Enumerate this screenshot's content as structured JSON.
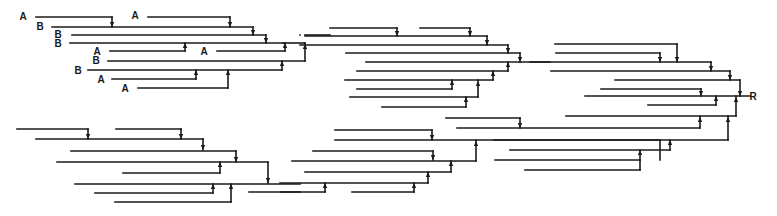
{
  "diagram": {
    "type": "merge-tree",
    "stroke_color": "#1a1a1a",
    "background": "#ffffff",
    "labels": [
      {
        "text": "A",
        "x": 23,
        "y": 20
      },
      {
        "text": "B",
        "x": 40,
        "y": 30
      },
      {
        "text": "B",
        "x": 58,
        "y": 38
      },
      {
        "text": "B",
        "x": 58,
        "y": 47
      },
      {
        "text": "A",
        "x": 97,
        "y": 55
      },
      {
        "text": "B",
        "x": 96,
        "y": 64
      },
      {
        "text": "B",
        "x": 78,
        "y": 74
      },
      {
        "text": "A",
        "x": 101,
        "y": 83
      },
      {
        "text": "A",
        "x": 125,
        "y": 92
      },
      {
        "text": "A",
        "x": 135,
        "y": 19
      },
      {
        "text": "A",
        "x": 204,
        "y": 55
      },
      {
        "text": "R",
        "x": 753,
        "y": 100
      }
    ],
    "segments": [
      {
        "x1": 36,
        "y1": 17,
        "x2": 112,
        "y2": 17
      },
      {
        "x1": 112,
        "y1": 17,
        "x2": 112,
        "y2": 27
      },
      {
        "x1": 148,
        "y1": 17,
        "x2": 230,
        "y2": 17
      },
      {
        "x1": 230,
        "y1": 17,
        "x2": 230,
        "y2": 27
      },
      {
        "x1": 52,
        "y1": 27,
        "x2": 253,
        "y2": 27
      },
      {
        "x1": 253,
        "y1": 27,
        "x2": 253,
        "y2": 35
      },
      {
        "x1": 72,
        "y1": 35,
        "x2": 266,
        "y2": 35
      },
      {
        "x1": 266,
        "y1": 35,
        "x2": 266,
        "y2": 43
      },
      {
        "x1": 70,
        "y1": 43,
        "x2": 283,
        "y2": 43
      },
      {
        "x1": 110,
        "y1": 51,
        "x2": 185,
        "y2": 51
      },
      {
        "x1": 185,
        "y1": 51,
        "x2": 185,
        "y2": 43
      },
      {
        "x1": 217,
        "y1": 51,
        "x2": 285,
        "y2": 51
      },
      {
        "x1": 285,
        "y1": 51,
        "x2": 285,
        "y2": 43
      },
      {
        "x1": 283,
        "y1": 43,
        "x2": 305,
        "y2": 43
      },
      {
        "x1": 108,
        "y1": 61,
        "x2": 305,
        "y2": 61
      },
      {
        "x1": 305,
        "y1": 61,
        "x2": 305,
        "y2": 43
      },
      {
        "x1": 88,
        "y1": 70,
        "x2": 282,
        "y2": 70
      },
      {
        "x1": 282,
        "y1": 70,
        "x2": 282,
        "y2": 61
      },
      {
        "x1": 112,
        "y1": 79,
        "x2": 196,
        "y2": 79
      },
      {
        "x1": 196,
        "y1": 79,
        "x2": 196,
        "y2": 70
      },
      {
        "x1": 138,
        "y1": 88,
        "x2": 228,
        "y2": 88
      },
      {
        "x1": 228,
        "y1": 88,
        "x2": 228,
        "y2": 70
      },
      {
        "x1": 300,
        "y1": 35,
        "x2": 300,
        "y2": 35
      },
      {
        "x1": 305,
        "y1": 35,
        "x2": 330,
        "y2": 35
      },
      {
        "x1": 330,
        "y1": 28,
        "x2": 397,
        "y2": 28
      },
      {
        "x1": 397,
        "y1": 28,
        "x2": 397,
        "y2": 36
      },
      {
        "x1": 420,
        "y1": 28,
        "x2": 470,
        "y2": 28
      },
      {
        "x1": 470,
        "y1": 28,
        "x2": 470,
        "y2": 36
      },
      {
        "x1": 305,
        "y1": 36,
        "x2": 487,
        "y2": 36
      },
      {
        "x1": 487,
        "y1": 36,
        "x2": 487,
        "y2": 45
      },
      {
        "x1": 300,
        "y1": 45,
        "x2": 508,
        "y2": 45
      },
      {
        "x1": 508,
        "y1": 45,
        "x2": 508,
        "y2": 53
      },
      {
        "x1": 346,
        "y1": 53,
        "x2": 520,
        "y2": 53
      },
      {
        "x1": 520,
        "y1": 53,
        "x2": 520,
        "y2": 62
      },
      {
        "x1": 366,
        "y1": 62,
        "x2": 550,
        "y2": 62
      },
      {
        "x1": 357,
        "y1": 71,
        "x2": 508,
        "y2": 71
      },
      {
        "x1": 508,
        "y1": 71,
        "x2": 508,
        "y2": 62
      },
      {
        "x1": 345,
        "y1": 80,
        "x2": 493,
        "y2": 80
      },
      {
        "x1": 493,
        "y1": 80,
        "x2": 493,
        "y2": 71
      },
      {
        "x1": 357,
        "y1": 89,
        "x2": 452,
        "y2": 89
      },
      {
        "x1": 452,
        "y1": 89,
        "x2": 452,
        "y2": 80
      },
      {
        "x1": 350,
        "y1": 97,
        "x2": 478,
        "y2": 97
      },
      {
        "x1": 478,
        "y1": 97,
        "x2": 478,
        "y2": 80
      },
      {
        "x1": 382,
        "y1": 107,
        "x2": 466,
        "y2": 107
      },
      {
        "x1": 466,
        "y1": 107,
        "x2": 466,
        "y2": 97
      },
      {
        "x1": 555,
        "y1": 44,
        "x2": 677,
        "y2": 44
      },
      {
        "x1": 677,
        "y1": 44,
        "x2": 677,
        "y2": 62
      },
      {
        "x1": 556,
        "y1": 53,
        "x2": 660,
        "y2": 53
      },
      {
        "x1": 660,
        "y1": 53,
        "x2": 660,
        "y2": 62
      },
      {
        "x1": 530,
        "y1": 62,
        "x2": 711,
        "y2": 62
      },
      {
        "x1": 711,
        "y1": 62,
        "x2": 711,
        "y2": 71
      },
      {
        "x1": 551,
        "y1": 71,
        "x2": 730,
        "y2": 71
      },
      {
        "x1": 730,
        "y1": 71,
        "x2": 730,
        "y2": 80
      },
      {
        "x1": 615,
        "y1": 80,
        "x2": 740,
        "y2": 80
      },
      {
        "x1": 740,
        "y1": 80,
        "x2": 740,
        "y2": 96
      },
      {
        "x1": 601,
        "y1": 89,
        "x2": 701,
        "y2": 89
      },
      {
        "x1": 701,
        "y1": 89,
        "x2": 701,
        "y2": 96
      },
      {
        "x1": 585,
        "y1": 96,
        "x2": 750,
        "y2": 96
      },
      {
        "x1": 648,
        "y1": 105,
        "x2": 716,
        "y2": 105
      },
      {
        "x1": 716,
        "y1": 105,
        "x2": 716,
        "y2": 96
      },
      {
        "x1": 566,
        "y1": 116,
        "x2": 736,
        "y2": 116
      },
      {
        "x1": 736,
        "y1": 116,
        "x2": 736,
        "y2": 96
      },
      {
        "x1": 446,
        "y1": 118,
        "x2": 520,
        "y2": 118
      },
      {
        "x1": 520,
        "y1": 118,
        "x2": 520,
        "y2": 128
      },
      {
        "x1": 457,
        "y1": 128,
        "x2": 700,
        "y2": 128
      },
      {
        "x1": 700,
        "y1": 128,
        "x2": 700,
        "y2": 116
      },
      {
        "x1": 494,
        "y1": 140,
        "x2": 728,
        "y2": 140
      },
      {
        "x1": 728,
        "y1": 140,
        "x2": 728,
        "y2": 116
      },
      {
        "x1": 510,
        "y1": 150,
        "x2": 670,
        "y2": 150
      },
      {
        "x1": 670,
        "y1": 150,
        "x2": 670,
        "y2": 140
      },
      {
        "x1": 335,
        "y1": 130,
        "x2": 432,
        "y2": 130
      },
      {
        "x1": 432,
        "y1": 130,
        "x2": 432,
        "y2": 140
      },
      {
        "x1": 335,
        "y1": 140,
        "x2": 660,
        "y2": 140
      },
      {
        "x1": 660,
        "y1": 140,
        "x2": 660,
        "y2": 160
      },
      {
        "x1": 495,
        "y1": 160,
        "x2": 640,
        "y2": 160
      },
      {
        "x1": 640,
        "y1": 160,
        "x2": 640,
        "y2": 150
      },
      {
        "x1": 525,
        "y1": 170,
        "x2": 640,
        "y2": 170
      },
      {
        "x1": 640,
        "y1": 170,
        "x2": 640,
        "y2": 160
      },
      {
        "x1": 313,
        "y1": 151,
        "x2": 433,
        "y2": 151
      },
      {
        "x1": 433,
        "y1": 151,
        "x2": 433,
        "y2": 160
      },
      {
        "x1": 292,
        "y1": 161,
        "x2": 476,
        "y2": 161
      },
      {
        "x1": 476,
        "y1": 161,
        "x2": 476,
        "y2": 140
      },
      {
        "x1": 305,
        "y1": 172,
        "x2": 451,
        "y2": 172
      },
      {
        "x1": 451,
        "y1": 172,
        "x2": 451,
        "y2": 161
      },
      {
        "x1": 280,
        "y1": 183,
        "x2": 428,
        "y2": 183
      },
      {
        "x1": 428,
        "y1": 183,
        "x2": 428,
        "y2": 172
      },
      {
        "x1": 281,
        "y1": 192,
        "x2": 325,
        "y2": 192
      },
      {
        "x1": 325,
        "y1": 192,
        "x2": 325,
        "y2": 183
      },
      {
        "x1": 352,
        "y1": 192,
        "x2": 414,
        "y2": 192
      },
      {
        "x1": 414,
        "y1": 192,
        "x2": 414,
        "y2": 183
      },
      {
        "x1": 17,
        "y1": 129,
        "x2": 88,
        "y2": 129
      },
      {
        "x1": 88,
        "y1": 129,
        "x2": 88,
        "y2": 139
      },
      {
        "x1": 116,
        "y1": 129,
        "x2": 181,
        "y2": 129
      },
      {
        "x1": 181,
        "y1": 129,
        "x2": 181,
        "y2": 139
      },
      {
        "x1": 36,
        "y1": 139,
        "x2": 203,
        "y2": 139
      },
      {
        "x1": 203,
        "y1": 139,
        "x2": 203,
        "y2": 150
      },
      {
        "x1": 71,
        "y1": 151,
        "x2": 236,
        "y2": 151
      },
      {
        "x1": 236,
        "y1": 151,
        "x2": 236,
        "y2": 162
      },
      {
        "x1": 57,
        "y1": 162,
        "x2": 268,
        "y2": 162
      },
      {
        "x1": 268,
        "y1": 162,
        "x2": 268,
        "y2": 183
      },
      {
        "x1": 123,
        "y1": 173,
        "x2": 220,
        "y2": 173
      },
      {
        "x1": 220,
        "y1": 173,
        "x2": 220,
        "y2": 162
      },
      {
        "x1": 75,
        "y1": 184,
        "x2": 300,
        "y2": 184
      },
      {
        "x1": 95,
        "y1": 193,
        "x2": 213,
        "y2": 193
      },
      {
        "x1": 213,
        "y1": 193,
        "x2": 213,
        "y2": 184
      },
      {
        "x1": 115,
        "y1": 202,
        "x2": 231,
        "y2": 202
      },
      {
        "x1": 231,
        "y1": 202,
        "x2": 231,
        "y2": 184
      },
      {
        "x1": 249,
        "y1": 192,
        "x2": 300,
        "y2": 192
      }
    ],
    "arrows": [
      {
        "x": 112,
        "y": 26,
        "dir": "down"
      },
      {
        "x": 230,
        "y": 26,
        "dir": "down"
      },
      {
        "x": 253,
        "y": 34,
        "dir": "down"
      },
      {
        "x": 266,
        "y": 42,
        "dir": "down"
      },
      {
        "x": 185,
        "y": 44,
        "dir": "up"
      },
      {
        "x": 285,
        "y": 44,
        "dir": "up"
      },
      {
        "x": 305,
        "y": 45,
        "dir": "up"
      },
      {
        "x": 282,
        "y": 62,
        "dir": "up"
      },
      {
        "x": 196,
        "y": 71,
        "dir": "up"
      },
      {
        "x": 228,
        "y": 71,
        "dir": "up"
      },
      {
        "x": 397,
        "y": 35,
        "dir": "down"
      },
      {
        "x": 470,
        "y": 35,
        "dir": "down"
      },
      {
        "x": 487,
        "y": 44,
        "dir": "down"
      },
      {
        "x": 508,
        "y": 52,
        "dir": "down"
      },
      {
        "x": 520,
        "y": 61,
        "dir": "down"
      },
      {
        "x": 508,
        "y": 63,
        "dir": "up"
      },
      {
        "x": 493,
        "y": 72,
        "dir": "up"
      },
      {
        "x": 452,
        "y": 81,
        "dir": "up"
      },
      {
        "x": 478,
        "y": 82,
        "dir": "up"
      },
      {
        "x": 466,
        "y": 98,
        "dir": "up"
      },
      {
        "x": 677,
        "y": 61,
        "dir": "down"
      },
      {
        "x": 660,
        "y": 61,
        "dir": "down"
      },
      {
        "x": 711,
        "y": 70,
        "dir": "down"
      },
      {
        "x": 730,
        "y": 79,
        "dir": "down"
      },
      {
        "x": 740,
        "y": 95,
        "dir": "down"
      },
      {
        "x": 701,
        "y": 95,
        "dir": "down"
      },
      {
        "x": 716,
        "y": 97,
        "dir": "up"
      },
      {
        "x": 736,
        "y": 98,
        "dir": "up"
      },
      {
        "x": 520,
        "y": 127,
        "dir": "down"
      },
      {
        "x": 700,
        "y": 118,
        "dir": "up"
      },
      {
        "x": 728,
        "y": 118,
        "dir": "up"
      },
      {
        "x": 670,
        "y": 141,
        "dir": "up"
      },
      {
        "x": 432,
        "y": 139,
        "dir": "down"
      },
      {
        "x": 640,
        "y": 151,
        "dir": "up"
      },
      {
        "x": 433,
        "y": 159,
        "dir": "down"
      },
      {
        "x": 476,
        "y": 142,
        "dir": "up"
      },
      {
        "x": 451,
        "y": 162,
        "dir": "up"
      },
      {
        "x": 428,
        "y": 173,
        "dir": "up"
      },
      {
        "x": 325,
        "y": 184,
        "dir": "up"
      },
      {
        "x": 414,
        "y": 184,
        "dir": "up"
      },
      {
        "x": 88,
        "y": 138,
        "dir": "down"
      },
      {
        "x": 181,
        "y": 138,
        "dir": "down"
      },
      {
        "x": 203,
        "y": 149,
        "dir": "down"
      },
      {
        "x": 236,
        "y": 161,
        "dir": "down"
      },
      {
        "x": 268,
        "y": 182,
        "dir": "down"
      },
      {
        "x": 220,
        "y": 163,
        "dir": "up"
      },
      {
        "x": 213,
        "y": 185,
        "dir": "up"
      },
      {
        "x": 231,
        "y": 185,
        "dir": "up"
      }
    ]
  }
}
